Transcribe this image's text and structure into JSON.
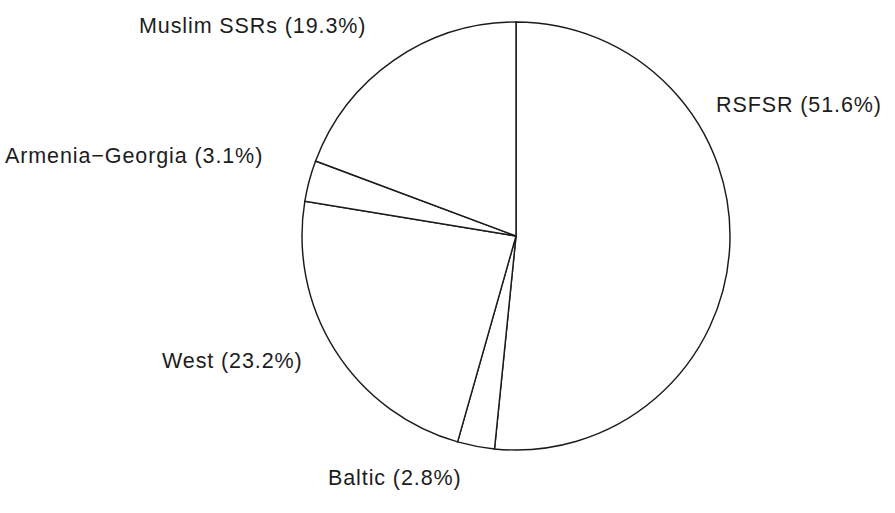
{
  "chart_data": {
    "type": "pie",
    "title": "",
    "subtitle": "",
    "xlabel": "",
    "ylabel": "",
    "legend_position": "none",
    "grid": false,
    "value_unit": "percent",
    "start_angle_deg": 0,
    "direction": "clockwise",
    "categories": [
      "RSFSR",
      "Baltic",
      "West",
      "Armenia−Georgia",
      "Muslim SSRs"
    ],
    "values": [
      51.6,
      2.8,
      23.2,
      3.1,
      19.3
    ],
    "slices": [
      {
        "name": "RSFSR",
        "value": 51.6,
        "label": "RSFSR (51.6%)",
        "start_angle_deg": 0.0,
        "end_angle_deg": 185.76,
        "color": "#ffffff",
        "stroke": "#1b1b1b"
      },
      {
        "name": "Baltic",
        "value": 2.8,
        "label": "Baltic (2.8%)",
        "start_angle_deg": 185.76,
        "end_angle_deg": 195.84,
        "color": "#ffffff",
        "stroke": "#1b1b1b"
      },
      {
        "name": "West",
        "value": 23.2,
        "label": "West (23.2%)",
        "start_angle_deg": 195.84,
        "end_angle_deg": 279.36,
        "color": "#ffffff",
        "stroke": "#1b1b1b"
      },
      {
        "name": "Armenia−Georgia",
        "value": 3.1,
        "label": "Armenia−Georgia (3.1%)",
        "start_angle_deg": 279.36,
        "end_angle_deg": 290.52,
        "color": "#ffffff",
        "stroke": "#1b1b1b"
      },
      {
        "name": "Muslim SSRs",
        "value": 19.3,
        "label": "Muslim SSRs (19.3%)",
        "start_angle_deg": 290.52,
        "end_angle_deg": 360.0,
        "color": "#ffffff",
        "stroke": "#1b1b1b"
      }
    ],
    "annotations": [
      "Muslim SSRs (19.3%)",
      "RSFSR (51.6%)",
      "Armenia−Georgia (3.1%)",
      "West (23.2%)",
      "Baltic (2.8%)"
    ]
  },
  "labels": {
    "muslim_ssrs": "Muslim SSRs (19.3%)",
    "rsfsr": "RSFSR (51.6%)",
    "armenia_georgia": "Armenia−Georgia (3.1%)",
    "west": "West (23.2%)",
    "baltic": "Baltic (2.8%)"
  },
  "colors": {
    "background": "#ffffff",
    "line": "#1b1b1b",
    "text": "#1d1d1d"
  },
  "geometry": {
    "center_x": 516,
    "center_y": 236,
    "radius": 214
  }
}
